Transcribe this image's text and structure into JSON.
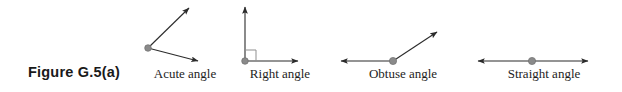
{
  "figure": {
    "caption": "Figure G.5(a)",
    "background_color": "#ffffff",
    "stroke_color": "#2b2b2b",
    "vertex_dot_color": "#8a8a8a",
    "vertex_dot_edge_color": "#6e6e6e",
    "label_color": "#1d1d1d",
    "caption_color": "#1a1a1a"
  },
  "diagrams": [
    {
      "id": "acute-angle",
      "label": "Acute angle",
      "vertex": {
        "x": 148,
        "y": 48
      },
      "rays": [
        {
          "name": "upper-right-ray",
          "to": {
            "x": 192,
            "y": 5
          },
          "arrow": true
        },
        {
          "name": "lower-right-ray",
          "to": {
            "x": 202,
            "y": 62
          },
          "arrow": true
        }
      ],
      "right_angle_marker": false
    },
    {
      "id": "right-angle",
      "label": "Right angle",
      "vertex": {
        "x": 245,
        "y": 61
      },
      "rays": [
        {
          "name": "vertical-ray",
          "to": {
            "x": 245,
            "y": 4
          },
          "arrow": true
        },
        {
          "name": "horizontal-ray",
          "to": {
            "x": 302,
            "y": 61
          },
          "arrow": true
        }
      ],
      "right_angle_marker": true,
      "marker_size": 11
    },
    {
      "id": "obtuse-angle",
      "label": "Obtuse angle",
      "vertex": {
        "x": 393,
        "y": 61
      },
      "rays": [
        {
          "name": "left-horizontal-ray",
          "to": {
            "x": 337,
            "y": 61
          },
          "arrow": true
        },
        {
          "name": "upper-right-ray",
          "to": {
            "x": 441,
            "y": 29
          },
          "arrow": true
        }
      ],
      "right_angle_marker": false
    },
    {
      "id": "straight-angle",
      "label": "Straight angle",
      "vertex": {
        "x": 532,
        "y": 61
      },
      "rays": [
        {
          "name": "left-ray",
          "to": {
            "x": 474,
            "y": 61
          },
          "arrow": true
        },
        {
          "name": "right-ray",
          "to": {
            "x": 592,
            "y": 61
          },
          "arrow": true
        }
      ],
      "right_angle_marker": false
    }
  ]
}
